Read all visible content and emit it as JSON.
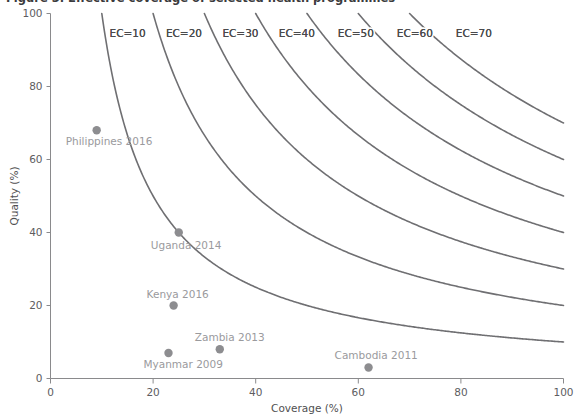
{
  "figure": {
    "title_clipped": "Figure 3. Effective coverage of selected health programmes",
    "background": "#ffffff"
  },
  "colors": {
    "curve": "#6f6f72",
    "point": "#8d8d90",
    "point_label": "#9a9a9d",
    "axis": "#8a8a8c",
    "text": "#4f4f51"
  },
  "chart_data": {
    "type": "scatter",
    "title": "Figure 3. Effective coverage of selected health programmes",
    "xlabel": "Coverage (%)",
    "ylabel": "Quality (%)",
    "xlim": [
      0,
      100
    ],
    "ylim": [
      0,
      100
    ],
    "xticks": [
      0,
      20,
      40,
      60,
      80,
      100
    ],
    "yticks": [
      0,
      20,
      40,
      60,
      80,
      100
    ],
    "xtick_labels": [
      "0",
      "20",
      "40",
      "60",
      "80",
      "100"
    ],
    "ytick_labels": [
      "0",
      "20",
      "40",
      "60",
      "80",
      "100"
    ],
    "grid": false,
    "legend": "none",
    "points": [
      {
        "label": "Philippines 2016",
        "x": 9,
        "y": 68,
        "label_dx": -31,
        "label_dy": 15,
        "anchor": "start"
      },
      {
        "label": "Uganda 2014",
        "x": 25,
        "y": 40,
        "label_dx": -28,
        "label_dy": 16,
        "anchor": "start"
      },
      {
        "label": "Kenya 2016",
        "x": 24,
        "y": 20,
        "label_dx": -27,
        "label_dy": -8,
        "anchor": "start"
      },
      {
        "label": "Zambia 2013",
        "x": 33,
        "y": 8,
        "label_dx": -25,
        "label_dy": -8,
        "anchor": "start"
      },
      {
        "label": "Myanmar 2009",
        "x": 23,
        "y": 7,
        "label_dx": -25,
        "label_dy": 15,
        "anchor": "start"
      },
      {
        "label": "Cambodia 2011",
        "x": 62,
        "y": 3,
        "label_dx": -34,
        "label_dy": -9,
        "anchor": "start"
      }
    ],
    "contours": {
      "formula": "Quality = 100 * EC / Coverage",
      "description": "Iso-effective-coverage hyperbolas; EC = Coverage x Quality / 100",
      "levels": [
        {
          "ec": 10,
          "label": "EC=10",
          "label_x": 11.5,
          "label_y": 93.5
        },
        {
          "ec": 20,
          "label": "EC=20",
          "label_x": 22.5,
          "label_y": 93.5
        },
        {
          "ec": 30,
          "label": "EC=30",
          "label_x": 33.5,
          "label_y": 93.5
        },
        {
          "ec": 40,
          "label": "EC=40",
          "label_x": 44.5,
          "label_y": 93.5
        },
        {
          "ec": 50,
          "label": "EC=50",
          "label_x": 56.0,
          "label_y": 93.5
        },
        {
          "ec": 60,
          "label": "EC=60",
          "label_x": 67.5,
          "label_y": 93.5
        },
        {
          "ec": 70,
          "label": "EC=70",
          "label_x": 79.0,
          "label_y": 93.5
        }
      ]
    }
  }
}
